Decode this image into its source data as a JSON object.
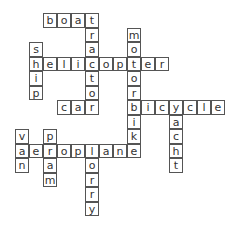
{
  "puzzle": {
    "type": "crossword",
    "cell_width": 14,
    "cell_height": 14.5,
    "origin_x": 29,
    "origin_y": 13,
    "words": [
      {
        "word": "boat",
        "dir": "across",
        "col": 1,
        "row": 0
      },
      {
        "word": "tractor",
        "dir": "down",
        "col": 4,
        "row": 0
      },
      {
        "word": "ship",
        "dir": "down",
        "col": 0,
        "row": 2
      },
      {
        "word": "helicopter",
        "dir": "across",
        "col": 0,
        "row": 3
      },
      {
        "word": "motorbike",
        "dir": "down",
        "col": 7,
        "row": 1
      },
      {
        "word": "car",
        "dir": "across",
        "col": 2,
        "row": 6
      },
      {
        "word": "bicycle",
        "dir": "across",
        "col": 7,
        "row": 6
      },
      {
        "word": "yacht",
        "dir": "down",
        "col": 10,
        "row": 6
      },
      {
        "word": "van",
        "dir": "down",
        "col": -1,
        "row": 8
      },
      {
        "word": "pram",
        "dir": "down",
        "col": 1,
        "row": 8
      },
      {
        "word": "aeroplane",
        "dir": "across",
        "col": -1,
        "row": 9
      },
      {
        "word": "lorry",
        "dir": "down",
        "col": 4,
        "row": 9
      }
    ]
  }
}
